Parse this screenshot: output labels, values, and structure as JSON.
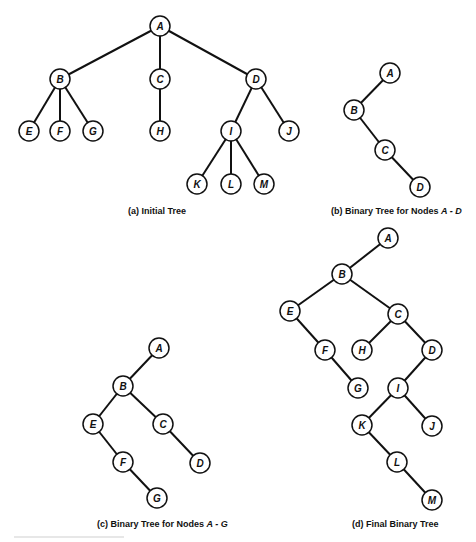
{
  "figure": {
    "panels": [
      {
        "id": "a",
        "caption_prefix": "(a) Initial Tree",
        "caption_var": "",
        "caption_x": 128,
        "caption_y": 206,
        "nodes": [
          {
            "label": "A",
            "x": 160,
            "y": 26
          },
          {
            "label": "B",
            "x": 60,
            "y": 79
          },
          {
            "label": "C",
            "x": 160,
            "y": 79
          },
          {
            "label": "D",
            "x": 256,
            "y": 79
          },
          {
            "label": "E",
            "x": 29,
            "y": 131
          },
          {
            "label": "F",
            "x": 60,
            "y": 131
          },
          {
            "label": "G",
            "x": 93,
            "y": 131
          },
          {
            "label": "H",
            "x": 160,
            "y": 131
          },
          {
            "label": "I",
            "x": 231,
            "y": 131
          },
          {
            "label": "J",
            "x": 289,
            "y": 131
          },
          {
            "label": "K",
            "x": 197,
            "y": 184
          },
          {
            "label": "L",
            "x": 231,
            "y": 184
          },
          {
            "label": "M",
            "x": 264,
            "y": 184
          }
        ],
        "edges": [
          [
            "A",
            "B"
          ],
          [
            "A",
            "C"
          ],
          [
            "A",
            "D"
          ],
          [
            "B",
            "E"
          ],
          [
            "B",
            "F"
          ],
          [
            "B",
            "G"
          ],
          [
            "C",
            "H"
          ],
          [
            "D",
            "I"
          ],
          [
            "D",
            "J"
          ],
          [
            "I",
            "K"
          ],
          [
            "I",
            "L"
          ],
          [
            "I",
            "M"
          ]
        ]
      },
      {
        "id": "b",
        "caption_prefix": "(b) Binary Tree for Nodes ",
        "caption_var": "A - D",
        "caption_x": 331,
        "caption_y": 206,
        "nodes": [
          {
            "label": "A",
            "x": 390,
            "y": 73
          },
          {
            "label": "B",
            "x": 354,
            "y": 110
          },
          {
            "label": "C",
            "x": 385,
            "y": 150
          },
          {
            "label": "D",
            "x": 420,
            "y": 187
          }
        ],
        "edges": [
          [
            "A",
            "B"
          ],
          [
            "B",
            "C"
          ],
          [
            "C",
            "D"
          ]
        ]
      },
      {
        "id": "c",
        "caption_prefix": "(c) Binary Tree for Nodes ",
        "caption_var": "A - G",
        "caption_x": 97,
        "caption_y": 519,
        "nodes": [
          {
            "label": "A",
            "x": 159,
            "y": 348
          },
          {
            "label": "B",
            "x": 123,
            "y": 386
          },
          {
            "label": "E",
            "x": 93,
            "y": 424
          },
          {
            "label": "C",
            "x": 163,
            "y": 424
          },
          {
            "label": "F",
            "x": 123,
            "y": 462
          },
          {
            "label": "D",
            "x": 200,
            "y": 463
          },
          {
            "label": "G",
            "x": 157,
            "y": 498
          }
        ],
        "edges": [
          [
            "A",
            "B"
          ],
          [
            "B",
            "E"
          ],
          [
            "B",
            "C"
          ],
          [
            "E",
            "F"
          ],
          [
            "C",
            "D"
          ],
          [
            "F",
            "G"
          ]
        ]
      },
      {
        "id": "d",
        "caption_prefix": "(d) Final Binary Tree",
        "caption_var": "",
        "caption_x": 352,
        "caption_y": 519,
        "nodes": [
          {
            "label": "A",
            "x": 388,
            "y": 238
          },
          {
            "label": "B",
            "x": 342,
            "y": 274
          },
          {
            "label": "E",
            "x": 290,
            "y": 311
          },
          {
            "label": "C",
            "x": 398,
            "y": 314
          },
          {
            "label": "F",
            "x": 325,
            "y": 350
          },
          {
            "label": "H",
            "x": 362,
            "y": 350
          },
          {
            "label": "D",
            "x": 432,
            "y": 350
          },
          {
            "label": "G",
            "x": 358,
            "y": 388
          },
          {
            "label": "I",
            "x": 398,
            "y": 388
          },
          {
            "label": "K",
            "x": 362,
            "y": 425
          },
          {
            "label": "J",
            "x": 432,
            "y": 426
          },
          {
            "label": "L",
            "x": 397,
            "y": 462
          },
          {
            "label": "M",
            "x": 432,
            "y": 500
          }
        ],
        "edges": [
          [
            "A",
            "B"
          ],
          [
            "B",
            "E"
          ],
          [
            "B",
            "C"
          ],
          [
            "E",
            "F"
          ],
          [
            "F",
            "G"
          ],
          [
            "C",
            "H"
          ],
          [
            "C",
            "D"
          ],
          [
            "D",
            "I"
          ],
          [
            "I",
            "K"
          ],
          [
            "I",
            "J"
          ],
          [
            "K",
            "L"
          ],
          [
            "L",
            "M"
          ]
        ]
      }
    ],
    "node_radius": 10,
    "colors": {
      "stroke": "#111111",
      "background": "#ffffff"
    }
  }
}
